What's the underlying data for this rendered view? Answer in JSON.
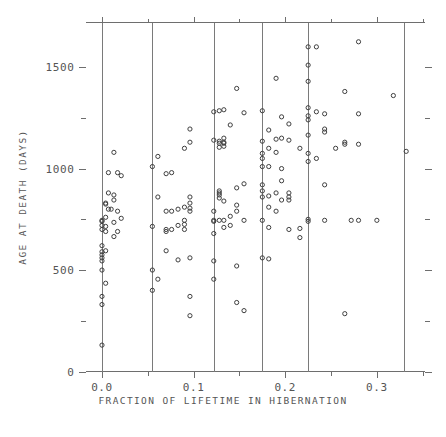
{
  "chart_data": {
    "type": "scatter",
    "title": "",
    "xlabel": "FRACTION OF LIFETIME IN HIBERNATION",
    "ylabel": "AGE AT DEATH (DAYS)",
    "xlim": [
      -0.018,
      0.352
    ],
    "ylim": [
      0,
      1720
    ],
    "xticks": [
      0.0,
      0.1,
      0.2,
      0.3
    ],
    "xticklabels": [
      "0.0",
      "0.1",
      "0.2",
      "0.3"
    ],
    "xminorticks": [
      0.05,
      0.15,
      0.25,
      0.35
    ],
    "yticks": [
      0,
      500,
      1000,
      1500
    ],
    "yticklabels": [
      "0",
      "500",
      "1000",
      "1500"
    ],
    "yminorticks": [
      250,
      750,
      1250,
      1750
    ],
    "grid": false,
    "legend": null,
    "marker": "open-circle",
    "marker_color": "#3f3f3f",
    "reference_lines_x": [
      0.0,
      0.055,
      0.122,
      0.175,
      0.225,
      0.33
    ],
    "points": [
      [
        0.0,
        130
      ],
      [
        0.0,
        330
      ],
      [
        0.0,
        370
      ],
      [
        0.0,
        500
      ],
      [
        0.0,
        545
      ],
      [
        0.0,
        560
      ],
      [
        0.0,
        575
      ],
      [
        0.0,
        590
      ],
      [
        0.0,
        620
      ],
      [
        0.0,
        700
      ],
      [
        0.0,
        720
      ],
      [
        0.0,
        740
      ],
      [
        0.0,
        745
      ],
      [
        0.004,
        435
      ],
      [
        0.004,
        595
      ],
      [
        0.004,
        690
      ],
      [
        0.004,
        715
      ],
      [
        0.004,
        760
      ],
      [
        0.004,
        825
      ],
      [
        0.004,
        830
      ],
      [
        0.007,
        800
      ],
      [
        0.007,
        880
      ],
      [
        0.007,
        980
      ],
      [
        0.01,
        800
      ],
      [
        0.013,
        665
      ],
      [
        0.013,
        735
      ],
      [
        0.013,
        845
      ],
      [
        0.013,
        870
      ],
      [
        0.013,
        1080
      ],
      [
        0.017,
        690
      ],
      [
        0.017,
        790
      ],
      [
        0.017,
        980
      ],
      [
        0.021,
        755
      ],
      [
        0.021,
        965
      ],
      [
        0.055,
        400
      ],
      [
        0.055,
        500
      ],
      [
        0.055,
        715
      ],
      [
        0.055,
        1010
      ],
      [
        0.061,
        455
      ],
      [
        0.061,
        860
      ],
      [
        0.061,
        1060
      ],
      [
        0.07,
        595
      ],
      [
        0.07,
        690
      ],
      [
        0.07,
        700
      ],
      [
        0.07,
        790
      ],
      [
        0.07,
        975
      ],
      [
        0.076,
        700
      ],
      [
        0.076,
        790
      ],
      [
        0.076,
        980
      ],
      [
        0.083,
        550
      ],
      [
        0.083,
        720
      ],
      [
        0.083,
        800
      ],
      [
        0.09,
        700
      ],
      [
        0.09,
        725
      ],
      [
        0.09,
        745
      ],
      [
        0.09,
        810
      ],
      [
        0.09,
        1100
      ],
      [
        0.096,
        275
      ],
      [
        0.096,
        370
      ],
      [
        0.096,
        560
      ],
      [
        0.096,
        790
      ],
      [
        0.096,
        805
      ],
      [
        0.096,
        830
      ],
      [
        0.096,
        860
      ],
      [
        0.096,
        1130
      ],
      [
        0.096,
        1195
      ],
      [
        0.122,
        455
      ],
      [
        0.122,
        545
      ],
      [
        0.122,
        680
      ],
      [
        0.122,
        740
      ],
      [
        0.122,
        745
      ],
      [
        0.122,
        790
      ],
      [
        0.122,
        1140
      ],
      [
        0.122,
        1280
      ],
      [
        0.128,
        745
      ],
      [
        0.128,
        855
      ],
      [
        0.128,
        870
      ],
      [
        0.128,
        880
      ],
      [
        0.128,
        890
      ],
      [
        0.128,
        1105
      ],
      [
        0.128,
        1125
      ],
      [
        0.128,
        1135
      ],
      [
        0.128,
        1285
      ],
      [
        0.133,
        710
      ],
      [
        0.133,
        745
      ],
      [
        0.133,
        840
      ],
      [
        0.133,
        1110
      ],
      [
        0.133,
        1125
      ],
      [
        0.133,
        1130
      ],
      [
        0.133,
        1150
      ],
      [
        0.133,
        1290
      ],
      [
        0.14,
        720
      ],
      [
        0.14,
        765
      ],
      [
        0.14,
        1215
      ],
      [
        0.147,
        340
      ],
      [
        0.147,
        520
      ],
      [
        0.147,
        790
      ],
      [
        0.147,
        820
      ],
      [
        0.147,
        905
      ],
      [
        0.147,
        1395
      ],
      [
        0.155,
        300
      ],
      [
        0.155,
        745
      ],
      [
        0.155,
        925
      ],
      [
        0.155,
        1275
      ],
      [
        0.175,
        560
      ],
      [
        0.175,
        745
      ],
      [
        0.175,
        860
      ],
      [
        0.175,
        890
      ],
      [
        0.175,
        920
      ],
      [
        0.175,
        1010
      ],
      [
        0.175,
        1050
      ],
      [
        0.175,
        1075
      ],
      [
        0.175,
        1135
      ],
      [
        0.175,
        1285
      ],
      [
        0.182,
        555
      ],
      [
        0.182,
        710
      ],
      [
        0.182,
        810
      ],
      [
        0.182,
        865
      ],
      [
        0.182,
        1010
      ],
      [
        0.182,
        1100
      ],
      [
        0.182,
        1190
      ],
      [
        0.19,
        790
      ],
      [
        0.19,
        880
      ],
      [
        0.19,
        1080
      ],
      [
        0.19,
        1145
      ],
      [
        0.19,
        1445
      ],
      [
        0.196,
        845
      ],
      [
        0.196,
        940
      ],
      [
        0.196,
        1000
      ],
      [
        0.196,
        1150
      ],
      [
        0.196,
        1255
      ],
      [
        0.204,
        700
      ],
      [
        0.204,
        845
      ],
      [
        0.204,
        860
      ],
      [
        0.204,
        880
      ],
      [
        0.204,
        1140
      ],
      [
        0.204,
        1220
      ],
      [
        0.216,
        660
      ],
      [
        0.216,
        705
      ],
      [
        0.216,
        1100
      ],
      [
        0.225,
        740
      ],
      [
        0.225,
        750
      ],
      [
        0.225,
        1035
      ],
      [
        0.225,
        1075
      ],
      [
        0.225,
        1165
      ],
      [
        0.225,
        1240
      ],
      [
        0.225,
        1260
      ],
      [
        0.225,
        1300
      ],
      [
        0.225,
        1430
      ],
      [
        0.225,
        1510
      ],
      [
        0.225,
        1600
      ],
      [
        0.234,
        1050
      ],
      [
        0.234,
        1280
      ],
      [
        0.234,
        1600
      ],
      [
        0.243,
        745
      ],
      [
        0.243,
        920
      ],
      [
        0.243,
        1180
      ],
      [
        0.243,
        1195
      ],
      [
        0.243,
        1270
      ],
      [
        0.255,
        1100
      ],
      [
        0.265,
        285
      ],
      [
        0.265,
        1120
      ],
      [
        0.265,
        1130
      ],
      [
        0.265,
        1380
      ],
      [
        0.272,
        745
      ],
      [
        0.28,
        745
      ],
      [
        0.28,
        1120
      ],
      [
        0.28,
        1270
      ],
      [
        0.28,
        1625
      ],
      [
        0.3,
        745
      ],
      [
        0.318,
        1360
      ],
      [
        0.332,
        1085
      ]
    ]
  }
}
